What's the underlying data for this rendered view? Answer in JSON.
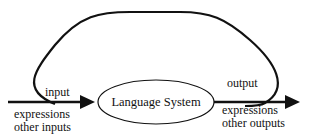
{
  "diagram": {
    "center_node": {
      "label": "Language System"
    },
    "input": {
      "label": "input",
      "items": [
        "expressions",
        "other inputs"
      ]
    },
    "output": {
      "label": "output",
      "items": [
        "expressions",
        "other outputs"
      ]
    },
    "feedback_loop": {
      "description": "loop from output back to input"
    },
    "colors": {
      "stroke": "#111111",
      "background": "#ffffff"
    }
  }
}
